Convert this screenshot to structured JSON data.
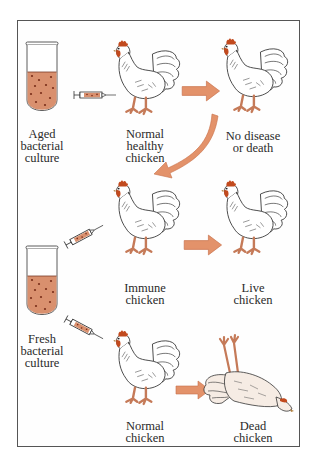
{
  "diagram": {
    "colors": {
      "culture": "#d9906e",
      "culture_dots": "#7a2e1a",
      "arrow": "#e3926a",
      "arrow_edge": "#c8704a",
      "comb": "#c24a1e",
      "legs": "#e2a283",
      "outline": "#333333",
      "frame": "#555555"
    },
    "labels": {
      "aged_culture": "Aged\nbacterial\nculture",
      "normal_healthy_chicken": "Normal\nhealthy\nchicken",
      "no_disease": "No disease\nor death",
      "immune_chicken": "Immune\nchicken",
      "live_chicken": "Live\nchicken",
      "fresh_culture": "Fresh\nbacterial\nculture",
      "normal_chicken": "Normal\nchicken",
      "dead_chicken": "Dead\nchicken"
    },
    "nodes": [
      {
        "id": "aged_culture",
        "icon": "test-tube"
      },
      {
        "id": "normal_healthy_chicken",
        "icon": "chicken"
      },
      {
        "id": "no_disease",
        "icon": "chicken"
      },
      {
        "id": "immune_chicken",
        "icon": "chicken"
      },
      {
        "id": "live_chicken",
        "icon": "chicken"
      },
      {
        "id": "fresh_culture",
        "icon": "test-tube"
      },
      {
        "id": "normal_chicken",
        "icon": "chicken"
      },
      {
        "id": "dead_chicken",
        "icon": "dead-chicken"
      }
    ],
    "edges": [
      {
        "from": "aged_culture",
        "to": "normal_healthy_chicken",
        "icon": "syringe"
      },
      {
        "from": "normal_healthy_chicken",
        "to": "no_disease",
        "icon": "arrow"
      },
      {
        "from": "no_disease",
        "to": "immune_chicken",
        "icon": "curved-arrow"
      },
      {
        "from": "fresh_culture",
        "to": "immune_chicken",
        "icon": "syringe"
      },
      {
        "from": "immune_chicken",
        "to": "live_chicken",
        "icon": "arrow"
      },
      {
        "from": "fresh_culture",
        "to": "normal_chicken",
        "icon": "syringe"
      },
      {
        "from": "normal_chicken",
        "to": "dead_chicken",
        "icon": "arrow"
      }
    ]
  }
}
